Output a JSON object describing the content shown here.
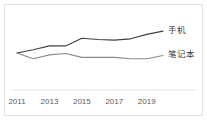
{
  "chart_data": {
    "type": "line",
    "title": "",
    "xlabel": "",
    "ylabel": "",
    "x": [
      2011,
      2012,
      2013,
      2014,
      2015,
      2016,
      2017,
      2018,
      2019,
      2020
    ],
    "tick_labels": [
      "2011",
      "2013",
      "2015",
      "2017",
      "2019"
    ],
    "tick_years": [
      2011,
      2013,
      2015,
      2017,
      2019
    ],
    "xlim": [
      2011,
      2020
    ],
    "ylim": [
      0,
      100
    ],
    "grid": false,
    "legend_position": "right-of-line-ends",
    "series": [
      {
        "name": "手机",
        "color": "#404040",
        "values": [
          47,
          52,
          58,
          58,
          70,
          68,
          67,
          69,
          76,
          81
        ]
      },
      {
        "name": "笔记本",
        "color": "#8a8a8a",
        "values": [
          47,
          38,
          44,
          46,
          40,
          40,
          40,
          38,
          38,
          43
        ]
      }
    ],
    "annotations": [
      {
        "name": "手机",
        "position": "end-of-series-1"
      },
      {
        "name": "笔记本",
        "position": "end-of-series-2"
      }
    ]
  },
  "chart": {
    "frame_color": "#e3e3e3",
    "background": "#ffffff",
    "axis_color": "#d8d8d8"
  }
}
